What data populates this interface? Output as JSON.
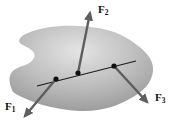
{
  "labels": {
    "f1": {
      "base": "F",
      "sub": "1"
    },
    "f2": {
      "base": "F",
      "sub": "2"
    },
    "f3": {
      "base": "F",
      "sub": "3"
    }
  },
  "colors": {
    "background": "#ffffff",
    "blob_highlight": "#e4e4e4",
    "blob_mid": "#bdbdbd",
    "blob_edge": "#989898",
    "arrow": "#5e5e5e",
    "line_of_action": "#1c1c1c",
    "dot": "#111111",
    "label": "#111111"
  }
}
